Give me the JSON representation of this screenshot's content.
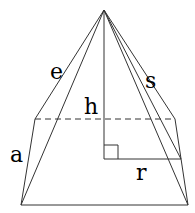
{
  "diagram": {
    "labels": {
      "edge": "e",
      "slant_height": "s",
      "height": "h",
      "base_side": "a",
      "inradius": "r"
    }
  }
}
